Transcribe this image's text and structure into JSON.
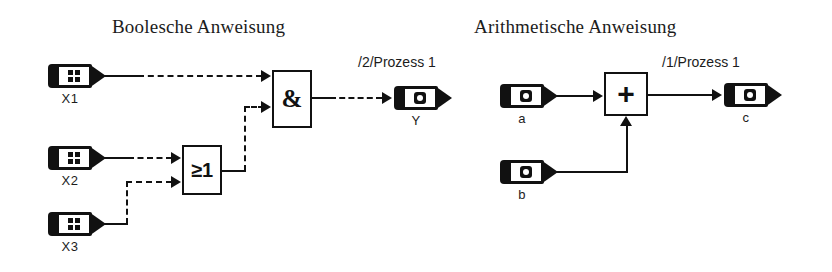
{
  "diagram": {
    "sections": [
      {
        "id": "boolean",
        "title": "Boolesche Anweisung"
      },
      {
        "id": "arithmetic",
        "title": "Arithmetische Anweisung"
      }
    ],
    "boolean": {
      "inputs": [
        {
          "label": "X1",
          "icon": "grid-icon"
        },
        {
          "label": "X2",
          "icon": "grid-icon"
        },
        {
          "label": "X3",
          "icon": "grid-icon"
        }
      ],
      "blocks": [
        {
          "id": "and-gate",
          "symbol": "&",
          "type": "AND"
        },
        {
          "id": "or-gate",
          "symbol": "≥1",
          "type": "OR"
        }
      ],
      "output": {
        "label": "Y",
        "icon": "round-icon"
      },
      "process_tag": "/2/Prozess  1"
    },
    "arithmetic": {
      "inputs": [
        {
          "label": "a",
          "icon": "round-icon"
        },
        {
          "label": "b",
          "icon": "round-icon"
        }
      ],
      "blocks": [
        {
          "id": "add-block",
          "symbol": "+",
          "type": "ADD"
        }
      ],
      "output": {
        "label": "c",
        "icon": "round-icon"
      },
      "process_tag": "/1/Prozess  1"
    },
    "colors": {
      "ink": "#111111",
      "paper": "#ffffff"
    }
  }
}
